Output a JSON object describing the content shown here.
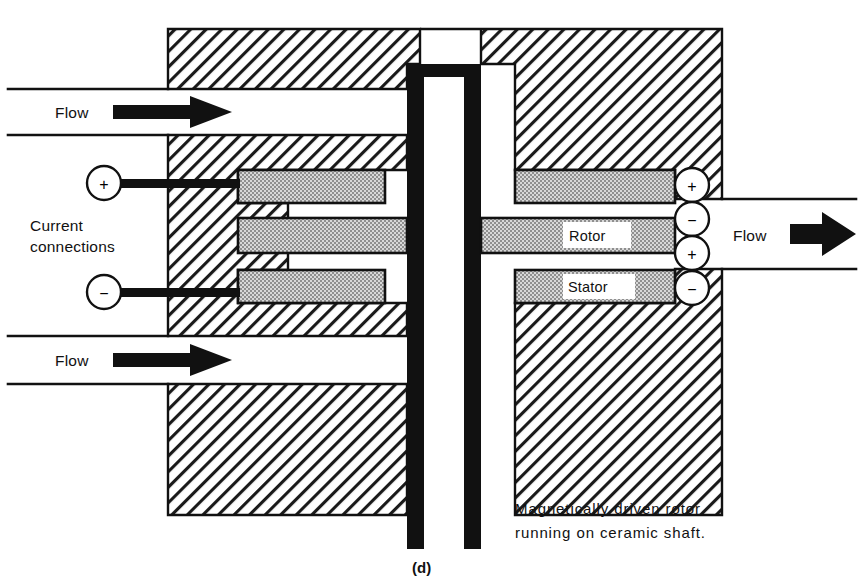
{
  "figure": {
    "label": "(d)",
    "caption_line1": "Magnetically driven rotor",
    "caption_line2": "running on ceramic shaft."
  },
  "labels": {
    "flow_top_left": "Flow",
    "flow_bottom_left": "Flow",
    "flow_right": "Flow",
    "current_connections_line1": "Current",
    "current_connections_line2": "connections",
    "rotor": "Rotor",
    "stator": "Stator"
  },
  "terminals": {
    "left": [
      {
        "id": "left-positive",
        "sign": "+"
      },
      {
        "id": "left-negative",
        "sign": "−"
      }
    ],
    "right": [
      {
        "id": "right-positive-top",
        "sign": "+"
      },
      {
        "id": "right-negative-upper",
        "sign": "−"
      },
      {
        "id": "right-positive-lower",
        "sign": "+"
      },
      {
        "id": "right-negative-bottom",
        "sign": "−"
      }
    ]
  },
  "colors": {
    "ink": "#111111",
    "hatch_line": "#1a1a1a",
    "stipple_fill": "#c9c9c9",
    "shaft_black": "#111111",
    "background": "#ffffff"
  },
  "components": {
    "housing": "hatched-cast-body",
    "shaft": "ceramic-shaft",
    "coil_bars": "stippled-magnet-bars"
  }
}
